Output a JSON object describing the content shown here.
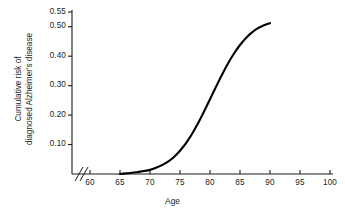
{
  "chart_data": {
    "type": "line",
    "title": "",
    "subtitle": "",
    "xlabel": "Age",
    "ylabel": "Cumulative risk of diagnosed Alzheimer's disease",
    "ylabel_lines": [
      "Cumulative risk of",
      "diagnosed Alzheimer's disease"
    ],
    "xlim": [
      57,
      100
    ],
    "ylim": [
      0,
      0.55
    ],
    "grid": false,
    "legend": null,
    "axis_break": {
      "axis": "x",
      "symbol": "//",
      "between": [
        57,
        59
      ],
      "note": "double slash break on x-axis before 60"
    },
    "xticks": [
      60,
      65,
      70,
      75,
      80,
      85,
      90,
      95,
      100
    ],
    "xtick_labels": [
      "60",
      "65",
      "70",
      "75",
      "80",
      "85",
      "90",
      "95",
      "100"
    ],
    "yticks": [
      0.1,
      0.2,
      0.3,
      0.4,
      0.5,
      0.55
    ],
    "ytick_labels": [
      "0.10",
      "0.20",
      "0.30",
      "0.40",
      "0.50",
      "0.55"
    ],
    "series": [
      {
        "name": "Cumulative risk of diagnosed Alzheimer's disease",
        "color": "#000000",
        "line_width": 2.1,
        "x": [
          65,
          66,
          67,
          68,
          69,
          70,
          71,
          72,
          73,
          74,
          75,
          76,
          77,
          78,
          79,
          80,
          81,
          82,
          83,
          84,
          85,
          86,
          87,
          88,
          89,
          90
        ],
        "y": [
          0.0,
          0.002,
          0.004,
          0.007,
          0.01,
          0.014,
          0.021,
          0.03,
          0.042,
          0.058,
          0.079,
          0.105,
          0.136,
          0.172,
          0.212,
          0.254,
          0.296,
          0.337,
          0.375,
          0.409,
          0.438,
          0.462,
          0.481,
          0.495,
          0.505,
          0.512
        ]
      }
    ]
  },
  "geometry": {
    "plot_left": 72,
    "plot_right": 333,
    "plot_bottom": 174,
    "plot_top": 12,
    "x_pixel_per_year": 6.0,
    "x_origin_year": 60,
    "x_origin_px": 90,
    "y_top_value": 0.55,
    "y_top_px": 12,
    "y_zero_px": 174
  }
}
